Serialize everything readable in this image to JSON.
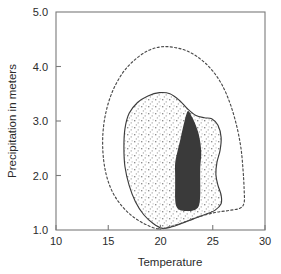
{
  "chart_data": {
    "type": "contour",
    "title": "",
    "xlabel": "Temperature",
    "ylabel": "Precipitation in meters",
    "xlim": [
      10,
      30
    ],
    "ylim": [
      1.0,
      5.0
    ],
    "xticks": [
      10,
      15,
      20,
      25,
      30
    ],
    "xtick_labels": [
      "10",
      "15",
      "20",
      "25",
      "30"
    ],
    "yticks": [
      1.0,
      2.0,
      3.0,
      4.0,
      5.0
    ],
    "ytick_labels": [
      "1.0",
      "2.0",
      "3.0",
      "4.0",
      "5.0"
    ],
    "grid": false,
    "legend": "none",
    "colors": {
      "core_fill": "#3a3a3a",
      "stipple_dot": "#9a9a9a",
      "contour_stroke": "#3c3c3c",
      "outer_dashed_stroke": "#4a4a4a",
      "axis": "#7a7a7a",
      "text": "#2b2b2b",
      "background": "#ffffff"
    },
    "series": [
      {
        "name": "outer-dashed-contour",
        "style": "dashed",
        "fill": "none",
        "points": [
          [
            19.8,
            1.02
          ],
          [
            18.6,
            1.1
          ],
          [
            17.4,
            1.24
          ],
          [
            16.3,
            1.44
          ],
          [
            15.4,
            1.7
          ],
          [
            14.8,
            2.02
          ],
          [
            14.5,
            2.4
          ],
          [
            14.5,
            2.8
          ],
          [
            14.8,
            3.18
          ],
          [
            15.4,
            3.54
          ],
          [
            16.3,
            3.86
          ],
          [
            17.4,
            4.1
          ],
          [
            18.7,
            4.28
          ],
          [
            20.0,
            4.36
          ],
          [
            21.3,
            4.35
          ],
          [
            22.6,
            4.28
          ],
          [
            23.8,
            4.14
          ],
          [
            24.9,
            3.94
          ],
          [
            25.9,
            3.66
          ],
          [
            26.7,
            3.3
          ],
          [
            27.3,
            2.9
          ],
          [
            27.7,
            2.5
          ],
          [
            27.9,
            2.1
          ],
          [
            28.0,
            1.76
          ],
          [
            28.0,
            1.5
          ],
          [
            27.6,
            1.4
          ],
          [
            26.6,
            1.36
          ],
          [
            25.2,
            1.32
          ],
          [
            23.6,
            1.24
          ],
          [
            22.2,
            1.14
          ],
          [
            20.9,
            1.06
          ]
        ]
      },
      {
        "name": "stippled-contour",
        "style": "solid",
        "fill": "stipple",
        "points": [
          [
            20.2,
            1.03
          ],
          [
            19.3,
            1.12
          ],
          [
            18.4,
            1.28
          ],
          [
            17.6,
            1.52
          ],
          [
            17.0,
            1.82
          ],
          [
            16.6,
            2.16
          ],
          [
            16.5,
            2.52
          ],
          [
            16.6,
            2.86
          ],
          [
            17.0,
            3.14
          ],
          [
            17.8,
            3.34
          ],
          [
            18.8,
            3.46
          ],
          [
            19.9,
            3.52
          ],
          [
            20.9,
            3.5
          ],
          [
            21.8,
            3.38
          ],
          [
            22.6,
            3.22
          ],
          [
            23.4,
            3.1
          ],
          [
            24.2,
            3.06
          ],
          [
            24.9,
            3.04
          ],
          [
            25.5,
            2.92
          ],
          [
            25.8,
            2.7
          ],
          [
            25.7,
            2.46
          ],
          [
            25.4,
            2.24
          ],
          [
            25.3,
            2.02
          ],
          [
            25.5,
            1.82
          ],
          [
            25.8,
            1.64
          ],
          [
            25.8,
            1.48
          ],
          [
            25.2,
            1.36
          ],
          [
            24.2,
            1.28
          ],
          [
            23.1,
            1.2
          ],
          [
            22.0,
            1.12
          ],
          [
            21.1,
            1.06
          ]
        ]
      },
      {
        "name": "dark-core-contour",
        "style": "filled",
        "fill": "#3a3a3a",
        "points": [
          [
            22.6,
            3.18
          ],
          [
            22.2,
            2.92
          ],
          [
            21.9,
            2.66
          ],
          [
            21.6,
            2.42
          ],
          [
            21.4,
            2.22
          ],
          [
            21.4,
            2.0
          ],
          [
            21.4,
            1.78
          ],
          [
            21.4,
            1.58
          ],
          [
            21.5,
            1.44
          ],
          [
            21.8,
            1.37
          ],
          [
            22.3,
            1.35
          ],
          [
            22.9,
            1.35
          ],
          [
            23.4,
            1.38
          ],
          [
            23.7,
            1.46
          ],
          [
            23.8,
            1.64
          ],
          [
            23.8,
            1.88
          ],
          [
            23.8,
            2.14
          ],
          [
            23.9,
            2.4
          ],
          [
            23.8,
            2.62
          ],
          [
            23.6,
            2.8
          ],
          [
            23.3,
            2.96
          ],
          [
            23.0,
            3.08
          ]
        ]
      }
    ]
  }
}
